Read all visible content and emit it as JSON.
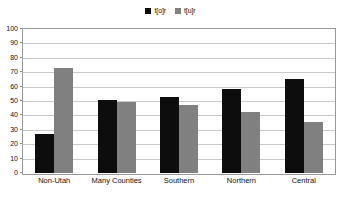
{
  "chart_data": {
    "type": "bar",
    "title": "",
    "xlabel": "",
    "ylabel": "",
    "ylim": [
      0,
      100
    ],
    "ytick_step": 10,
    "ytick_labels": [
      "100",
      "90",
      "80",
      "70",
      "60",
      "50",
      "40",
      "30",
      "20",
      "10",
      "0"
    ],
    "grid": true,
    "legend_position": "top-center",
    "categories": [
      "Non-Utah",
      "Many Counties",
      "Southern",
      "Northern",
      "Central"
    ],
    "series": [
      {
        "name": "t[o]r",
        "color": "#0d0d0d",
        "values": [
          27,
          51,
          53,
          58.5,
          65.5
        ]
      },
      {
        "name": "t[u]r",
        "color": "#808080",
        "values": [
          73,
          49,
          47,
          42.5,
          35.5
        ]
      }
    ]
  },
  "legend": {
    "entries": [
      {
        "label": "t[o]r",
        "swatch": "black-square-swatch"
      },
      {
        "label": "t[u]r",
        "swatch": "gray-square-swatch"
      }
    ]
  },
  "colors": {
    "series_0": "#0d0d0d",
    "series_1": "#808080",
    "gridline": "#c9c9c9",
    "plot_border": "#9a9a9a",
    "background": "#ffffff",
    "text": "#111111"
  }
}
